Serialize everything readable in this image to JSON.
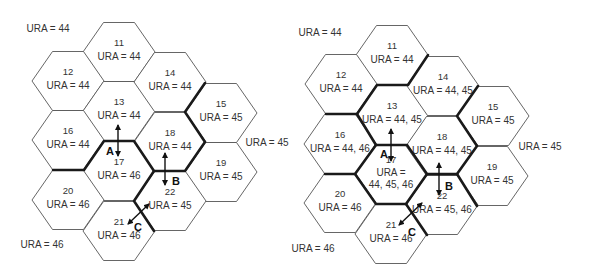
{
  "panels": [
    {
      "name": "left",
      "cells": [
        {
          "id": "11",
          "ura": "URA = 44",
          "cx": 119,
          "cy": 52
        },
        {
          "id": "12",
          "ura": "URA = 44",
          "cx": 68,
          "cy": 81
        },
        {
          "id": "13",
          "ura": "URA = 44",
          "cx": 119,
          "cy": 111
        },
        {
          "id": "14",
          "ura": "URA = 44",
          "cx": 170,
          "cy": 82
        },
        {
          "id": "15",
          "ura": "URA = 45",
          "cx": 221,
          "cy": 113
        },
        {
          "id": "16",
          "ura": "URA = 44",
          "cx": 68,
          "cy": 140
        },
        {
          "id": "17",
          "ura": "URA = 46",
          "cx": 119,
          "cy": 171
        },
        {
          "id": "18",
          "ura": "URA = 44",
          "cx": 170,
          "cy": 142
        },
        {
          "id": "19",
          "ura": "URA = 45",
          "cx": 221,
          "cy": 172
        },
        {
          "id": "20",
          "ura": "URA = 46",
          "cx": 68,
          "cy": 200
        },
        {
          "id": "21",
          "ura": "URA = 46",
          "cx": 119,
          "cy": 231
        },
        {
          "id": "22",
          "ura": "URA = 45",
          "cx": 170,
          "cy": 201
        }
      ],
      "area_labels": [
        {
          "text": "URA = 44",
          "x": 48,
          "y": 32
        },
        {
          "text": "URA = 45",
          "x": 267,
          "y": 146
        },
        {
          "text": "URA = 46",
          "x": 42,
          "y": 248
        }
      ],
      "boundaries": [
        "M53,170 L84,170 L104,141 L134,141 L154,171 L185,171 L205,142 L185,112 L205,83",
        "M154,171 L134,201 L154,231"
      ],
      "arrows": [
        {
          "label": "A",
          "x1": 118,
          "y1": 125,
          "x2": 118,
          "y2": 156,
          "lx": 110,
          "ly": 155
        },
        {
          "label": "B",
          "x1": 165,
          "y1": 153,
          "x2": 165,
          "y2": 185,
          "lx": 176,
          "ly": 185
        },
        {
          "label": "C",
          "x1": 128,
          "y1": 224,
          "x2": 149,
          "y2": 204,
          "lx": 138,
          "ly": 231
        }
      ]
    },
    {
      "name": "right",
      "cells": [
        {
          "id": "11",
          "ura": "URA = 44",
          "cx": 392,
          "cy": 55
        },
        {
          "id": "12",
          "ura": "URA = 44",
          "cx": 341,
          "cy": 84
        },
        {
          "id": "13",
          "ura": "URA = 44, 45",
          "cx": 392,
          "cy": 115
        },
        {
          "id": "14",
          "ura": "URA = 44, 45",
          "cx": 443,
          "cy": 86
        },
        {
          "id": "15",
          "ura": "URA = 45",
          "cx": 493,
          "cy": 116
        },
        {
          "id": "16",
          "ura": "URA = 44, 46",
          "cx": 340,
          "cy": 144
        },
        {
          "id": "17",
          "ura": "URA =",
          "ura2": "44, 45, 46",
          "cx": 391,
          "cy": 174
        },
        {
          "id": "18",
          "ura": "URA = 44, 45",
          "cx": 442,
          "cy": 146
        },
        {
          "id": "19",
          "ura": "URA = 45",
          "cx": 492,
          "cy": 176
        },
        {
          "id": "20",
          "ura": "URA = 46",
          "cx": 340,
          "cy": 203
        },
        {
          "id": "21",
          "ura": "URA = 46",
          "cx": 391,
          "cy": 234
        },
        {
          "id": "22",
          "ura": "URA = 45, 46",
          "cx": 442,
          "cy": 205
        }
      ],
      "area_labels": [
        {
          "text": "URA = 44",
          "x": 320,
          "y": 36
        },
        {
          "text": "URA = 45",
          "x": 540,
          "y": 150
        },
        {
          "text": "URA = 46",
          "x": 313,
          "y": 252
        }
      ],
      "boundaries": [
        "M428,55 L408,85 L377,85 L357,114 L326,114",
        "M357,114 L376,145 L407,145 L427,174 L457,174 L477,146 L457,116 L478,86",
        "M376,145 L355,174 L325,174",
        "M355,174 L376,204 L406,204 L427,174",
        "M406,204 L427,235",
        "M457,174 L477,206"
      ],
      "arrows": [
        {
          "label": "A",
          "x1": 391,
          "y1": 129,
          "x2": 391,
          "y2": 161,
          "lx": 384,
          "ly": 158
        },
        {
          "label": "B",
          "x1": 439,
          "y1": 163,
          "x2": 439,
          "y2": 195,
          "lx": 449,
          "ly": 190
        },
        {
          "label": "C",
          "x1": 399,
          "y1": 225,
          "x2": 422,
          "y2": 203,
          "lx": 412,
          "ly": 236
        }
      ]
    }
  ],
  "hex": {
    "half_width": 36,
    "edge_half": 15.5,
    "half_height": 29.5
  }
}
